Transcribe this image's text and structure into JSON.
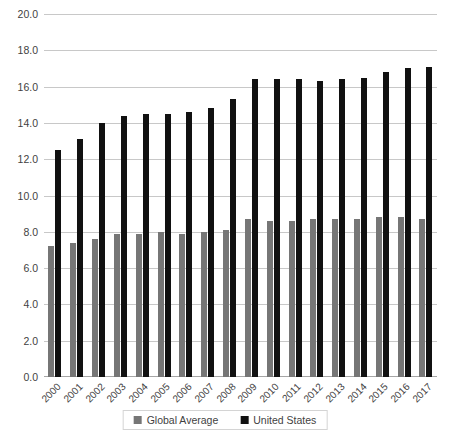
{
  "chart_data": {
    "type": "bar",
    "title": "",
    "xlabel": "",
    "ylabel": "",
    "ylim": [
      0.0,
      20.0
    ],
    "ytick_step": 2.0,
    "grid": true,
    "legend_position": "bottom",
    "categories": [
      "2000",
      "2001",
      "2002",
      "2003",
      "2004",
      "2005",
      "2006",
      "2007",
      "2008",
      "2009",
      "2010",
      "2011",
      "2012",
      "2013",
      "2014",
      "2015",
      "2016",
      "2017"
    ],
    "yticks": [
      "0.0",
      "2.0",
      "4.0",
      "6.0",
      "8.0",
      "10.0",
      "12.0",
      "14.0",
      "16.0",
      "18.0",
      "20.0"
    ],
    "series": [
      {
        "name": "Global Average",
        "color": "#767676",
        "values": [
          7.2,
          7.4,
          7.6,
          7.9,
          7.9,
          8.0,
          7.9,
          8.0,
          8.1,
          8.7,
          8.6,
          8.6,
          8.7,
          8.7,
          8.7,
          8.8,
          8.8,
          8.7
        ]
      },
      {
        "name": "United States",
        "color": "#111111",
        "values": [
          12.5,
          13.1,
          14.0,
          14.4,
          14.5,
          14.5,
          14.6,
          14.8,
          15.3,
          16.4,
          16.4,
          16.4,
          16.3,
          16.4,
          16.5,
          16.8,
          17.0,
          17.1
        ]
      }
    ]
  },
  "legend": {
    "items": [
      {
        "label": "Global Average",
        "color": "#767676"
      },
      {
        "label": "United States",
        "color": "#111111"
      }
    ]
  }
}
